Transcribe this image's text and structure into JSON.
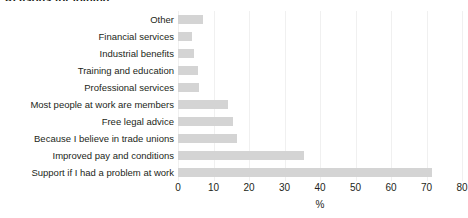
{
  "title_fragment": "Reasons for joining",
  "chart_data": {
    "type": "bar",
    "orientation": "horizontal",
    "title": "",
    "xlabel": "%",
    "ylabel": "",
    "xlim": [
      0,
      80
    ],
    "xticks": [
      0,
      10,
      20,
      30,
      40,
      50,
      60,
      70,
      80
    ],
    "grid": true,
    "legend": "none",
    "bar_color": "#d4d4d4",
    "categories": [
      "Other",
      "Financial services",
      "Industrial benefits",
      "Training and education",
      "Professional services",
      "Most people at work are members",
      "Free legal advice",
      "Because I believe in trade unions",
      "Improved pay and conditions",
      "Support if I had a problem at work"
    ],
    "values": [
      7,
      4,
      4.5,
      5.5,
      6,
      14,
      15.5,
      16.5,
      35.5,
      71.5
    ]
  }
}
